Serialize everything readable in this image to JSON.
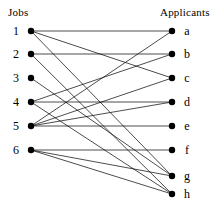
{
  "headings": {
    "left": "Jobs",
    "right": "Applicants"
  },
  "colors": {
    "background": "#ffffff",
    "node": "#000000",
    "edge": "#000000",
    "text": "#000000"
  },
  "geometry": {
    "width": 215,
    "height": 212,
    "left_x": 31,
    "right_x": 172,
    "dot_radius": 3.2
  },
  "left_nodes": [
    {
      "id": "1",
      "label": "1",
      "x": 31,
      "y": 31,
      "label_x": 16,
      "label_y": 31
    },
    {
      "id": "2",
      "label": "2",
      "x": 31,
      "y": 54,
      "label_x": 16,
      "label_y": 54
    },
    {
      "id": "3",
      "label": "3",
      "x": 31,
      "y": 78,
      "label_x": 16,
      "label_y": 78
    },
    {
      "id": "4",
      "label": "4",
      "x": 31,
      "y": 102,
      "label_x": 16,
      "label_y": 102
    },
    {
      "id": "5",
      "label": "5",
      "x": 31,
      "y": 126,
      "label_x": 16,
      "label_y": 126
    },
    {
      "id": "6",
      "label": "6",
      "x": 31,
      "y": 150,
      "label_x": 16,
      "label_y": 150
    }
  ],
  "right_nodes": [
    {
      "id": "a",
      "label": "a",
      "x": 172,
      "y": 31,
      "label_x": 187,
      "label_y": 31
    },
    {
      "id": "b",
      "label": "b",
      "x": 172,
      "y": 54,
      "label_x": 187,
      "label_y": 54
    },
    {
      "id": "c",
      "label": "c",
      "x": 172,
      "y": 78,
      "label_x": 187,
      "label_y": 78
    },
    {
      "id": "d",
      "label": "d",
      "x": 172,
      "y": 102,
      "label_x": 187,
      "label_y": 102
    },
    {
      "id": "e",
      "label": "e",
      "x": 172,
      "y": 126,
      "label_x": 187,
      "label_y": 126
    },
    {
      "id": "f",
      "label": "f",
      "x": 172,
      "y": 150,
      "label_x": 187,
      "label_y": 150
    },
    {
      "id": "g",
      "label": "g",
      "x": 172,
      "y": 176,
      "label_x": 187,
      "label_y": 176
    },
    {
      "id": "h",
      "label": "h",
      "x": 172,
      "y": 194,
      "label_x": 187,
      "label_y": 194
    }
  ],
  "edges": [
    {
      "from": "1",
      "to": "a"
    },
    {
      "from": "1",
      "to": "c"
    },
    {
      "from": "1",
      "to": "g"
    },
    {
      "from": "2",
      "to": "b"
    },
    {
      "from": "2",
      "to": "h"
    },
    {
      "from": "3",
      "to": "g"
    },
    {
      "from": "4",
      "to": "d"
    },
    {
      "from": "4",
      "to": "b"
    },
    {
      "from": "4",
      "to": "h"
    },
    {
      "from": "5",
      "to": "a"
    },
    {
      "from": "5",
      "to": "c"
    },
    {
      "from": "5",
      "to": "d"
    },
    {
      "from": "5",
      "to": "e"
    },
    {
      "from": "6",
      "to": "f"
    },
    {
      "from": "6",
      "to": "g"
    },
    {
      "from": "6",
      "to": "h"
    }
  ]
}
